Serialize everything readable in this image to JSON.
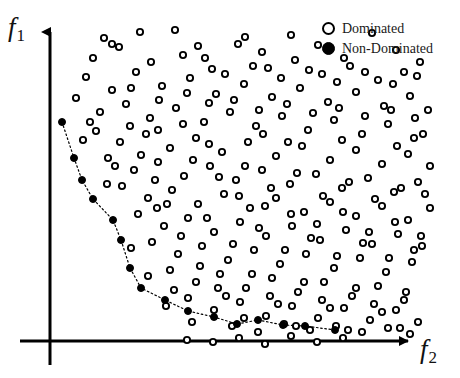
{
  "figure": {
    "background_color": "#ffffff",
    "ink_color": "#000000"
  },
  "axes": {
    "y_label": "f",
    "y_label_sub": "1",
    "x_label": "f",
    "x_label_sub": "2",
    "origin_x": 50,
    "origin_y": 341,
    "y_axis_top": 28,
    "y_axis_bottom": 365,
    "x_axis_right": 415,
    "arrow_style": "solid-triangle"
  },
  "legend": {
    "position": "top-right",
    "entries": [
      {
        "label": "Dominated",
        "marker": "hollow-circle",
        "color": "#000000"
      },
      {
        "label": "Non-Dominated",
        "marker": "filled-circle",
        "color": "#000000"
      }
    ]
  },
  "chart_data": {
    "type": "scatter",
    "title": "",
    "xlabel": "f2",
    "ylabel": "f1",
    "grid": false,
    "legend_position": "top-right",
    "xlim": [
      50,
      460
    ],
    "ylim": [
      378,
      0
    ],
    "note": "Pixel coordinates: x increases right, y increases downward (screen space).",
    "series": [
      {
        "name": "Dominated",
        "marker": "hollow-circle",
        "marker_size": 8,
        "color": "#000000",
        "count": 232,
        "points": [
          [
            104,
            38
          ],
          [
            140,
            32
          ],
          [
            175,
            30
          ],
          [
            198,
            46
          ],
          [
            245,
            37
          ],
          [
            262,
            52
          ],
          [
            291,
            35
          ],
          [
            318,
            45
          ],
          [
            344,
            58
          ],
          [
            372,
            33
          ],
          [
            396,
            50
          ],
          [
            420,
            62
          ],
          [
            93,
            58
          ],
          [
            119,
            47
          ],
          [
            151,
            62
          ],
          [
            183,
            55
          ],
          [
            212,
            69
          ],
          [
            238,
            44
          ],
          [
            268,
            68
          ],
          [
            295,
            60
          ],
          [
            322,
            74
          ],
          [
            350,
            66
          ],
          [
            378,
            80
          ],
          [
            404,
            72
          ],
          [
            86,
            77
          ],
          [
            112,
            90
          ],
          [
            136,
            72
          ],
          [
            162,
            86
          ],
          [
            190,
            78
          ],
          [
            216,
            94
          ],
          [
            244,
            84
          ],
          [
            272,
            97
          ],
          [
            300,
            88
          ],
          [
            328,
            102
          ],
          [
            356,
            92
          ],
          [
            384,
            106
          ],
          [
            410,
            96
          ],
          [
            428,
            110
          ],
          [
            76,
            98
          ],
          [
            100,
            112
          ],
          [
            126,
            104
          ],
          [
            150,
            118
          ],
          [
            176,
            108
          ],
          [
            204,
            122
          ],
          [
            230,
            112
          ],
          [
            256,
            126
          ],
          [
            282,
            116
          ],
          [
            308,
            130
          ],
          [
            334,
            120
          ],
          [
            362,
            134
          ],
          [
            388,
            124
          ],
          [
            414,
            138
          ],
          [
            96,
            131
          ],
          [
            120,
            142
          ],
          [
            146,
            134
          ],
          [
            170,
            148
          ],
          [
            196,
            138
          ],
          [
            222,
            152
          ],
          [
            248,
            142
          ],
          [
            276,
            156
          ],
          [
            302,
            146
          ],
          [
            330,
            160
          ],
          [
            356,
            150
          ],
          [
            382,
            164
          ],
          [
            408,
            154
          ],
          [
            430,
            166
          ],
          [
            108,
            158
          ],
          [
            134,
            170
          ],
          [
            158,
            162
          ],
          [
            184,
            176
          ],
          [
            210,
            166
          ],
          [
            236,
            180
          ],
          [
            262,
            170
          ],
          [
            290,
            184
          ],
          [
            316,
            174
          ],
          [
            342,
            188
          ],
          [
            368,
            178
          ],
          [
            394,
            192
          ],
          [
            418,
            182
          ],
          [
            122,
            186
          ],
          [
            148,
            198
          ],
          [
            172,
            190
          ],
          [
            198,
            204
          ],
          [
            224,
            194
          ],
          [
            250,
            208
          ],
          [
            276,
            198
          ],
          [
            304,
            212
          ],
          [
            330,
            202
          ],
          [
            356,
            216
          ],
          [
            382,
            206
          ],
          [
            408,
            220
          ],
          [
            430,
            208
          ],
          [
            138,
            214
          ],
          [
            164,
            226
          ],
          [
            188,
            218
          ],
          [
            214,
            232
          ],
          [
            240,
            222
          ],
          [
            266,
            236
          ],
          [
            292,
            226
          ],
          [
            320,
            240
          ],
          [
            346,
            230
          ],
          [
            372,
            244
          ],
          [
            398,
            234
          ],
          [
            422,
            246
          ],
          [
            152,
            242
          ],
          [
            178,
            254
          ],
          [
            202,
            246
          ],
          [
            228,
            260
          ],
          [
            254,
            250
          ],
          [
            280,
            264
          ],
          [
            306,
            254
          ],
          [
            334,
            268
          ],
          [
            360,
            258
          ],
          [
            386,
            272
          ],
          [
            412,
            262
          ],
          [
            170,
            270
          ],
          [
            196,
            282
          ],
          [
            220,
            274
          ],
          [
            246,
            288
          ],
          [
            272,
            278
          ],
          [
            298,
            292
          ],
          [
            324,
            282
          ],
          [
            352,
            296
          ],
          [
            378,
            286
          ],
          [
            404,
            300
          ],
          [
            188,
            298
          ],
          [
            214,
            310
          ],
          [
            240,
            302
          ],
          [
            266,
            316
          ],
          [
            292,
            306
          ],
          [
            318,
            318
          ],
          [
            344,
            308
          ],
          [
            370,
            320
          ],
          [
            396,
            310
          ],
          [
            418,
            322
          ],
          [
            232,
            326
          ],
          [
            258,
            332
          ],
          [
            284,
            324
          ],
          [
            310,
            330
          ],
          [
            336,
            326
          ],
          [
            362,
            332
          ],
          [
            388,
            328
          ],
          [
            410,
            334
          ],
          [
            112,
            44
          ],
          [
            131,
            88
          ],
          [
            159,
            100
          ],
          [
            187,
            93
          ],
          [
            209,
            103
          ],
          [
            234,
            100
          ],
          [
            259,
            110
          ],
          [
            287,
            104
          ],
          [
            313,
            113
          ],
          [
            339,
            108
          ],
          [
            365,
            116
          ],
          [
            391,
            110
          ],
          [
            415,
            118
          ],
          [
            90,
            122
          ],
          [
            115,
            166
          ],
          [
            141,
            155
          ],
          [
            167,
            204
          ],
          [
            193,
            160
          ],
          [
            219,
            177
          ],
          [
            245,
            166
          ],
          [
            271,
            188
          ],
          [
            297,
            173
          ],
          [
            323,
            196
          ],
          [
            349,
            182
          ],
          [
            375,
            199
          ],
          [
            401,
            188
          ],
          [
            425,
            194
          ],
          [
            131,
            248
          ],
          [
            157,
            208
          ],
          [
            181,
            236
          ],
          [
            207,
            218
          ],
          [
            233,
            244
          ],
          [
            259,
            228
          ],
          [
            285,
            250
          ],
          [
            311,
            238
          ],
          [
            337,
            256
          ],
          [
            363,
            243
          ],
          [
            389,
            258
          ],
          [
            414,
            250
          ],
          [
            148,
            276
          ],
          [
            174,
            290
          ],
          [
            200,
            266
          ],
          [
            226,
            296
          ],
          [
            252,
            274
          ],
          [
            278,
            304
          ],
          [
            304,
            282
          ],
          [
            330,
            308
          ],
          [
            356,
            288
          ],
          [
            382,
            312
          ],
          [
            406,
            292
          ],
          [
            166,
            306
          ],
          [
            192,
            322
          ],
          [
            218,
            288
          ],
          [
            244,
            318
          ],
          [
            270,
            296
          ],
          [
            296,
            326
          ],
          [
            322,
            300
          ],
          [
            348,
            330
          ],
          [
            374,
            304
          ],
          [
            400,
            328
          ],
          [
            205,
            58
          ],
          [
            225,
            74
          ],
          [
            253,
            66
          ],
          [
            281,
            78
          ],
          [
            309,
            70
          ],
          [
            337,
            82
          ],
          [
            365,
            72
          ],
          [
            393,
            84
          ],
          [
            417,
            76
          ],
          [
            83,
            140
          ],
          [
            107,
            184
          ],
          [
            158,
            130
          ],
          [
            263,
            134
          ],
          [
            288,
            142
          ],
          [
            342,
            140
          ],
          [
            397,
            146
          ],
          [
            423,
            134
          ],
          [
            209,
            144
          ],
          [
            183,
            124
          ],
          [
            130,
            126
          ],
          [
            155,
            180
          ],
          [
            239,
            196
          ],
          [
            265,
            206
          ],
          [
            291,
            214
          ],
          [
            317,
            224
          ],
          [
            343,
            212
          ],
          [
            369,
            232
          ],
          [
            395,
            222
          ],
          [
            421,
            236
          ],
          [
            187,
            340
          ],
          [
            213,
            342
          ],
          [
            239,
            338
          ],
          [
            265,
            344
          ],
          [
            291,
            336
          ],
          [
            317,
            342
          ],
          [
            343,
            338
          ]
        ]
      },
      {
        "name": "Non-Dominated",
        "marker": "filled-circle",
        "marker_size": 7,
        "color": "#000000",
        "connector": "dotted-line",
        "count": 16,
        "points": [
          [
            62,
            122
          ],
          [
            74,
            158
          ],
          [
            82,
            180
          ],
          [
            93,
            199
          ],
          [
            113,
            220
          ],
          [
            121,
            240
          ],
          [
            130,
            268
          ],
          [
            141,
            288
          ],
          [
            165,
            300
          ],
          [
            188,
            311
          ],
          [
            214,
            317
          ],
          [
            237,
            324
          ],
          [
            258,
            320
          ],
          [
            283,
            325
          ],
          [
            305,
            326
          ],
          [
            335,
            330
          ]
        ]
      }
    ]
  }
}
